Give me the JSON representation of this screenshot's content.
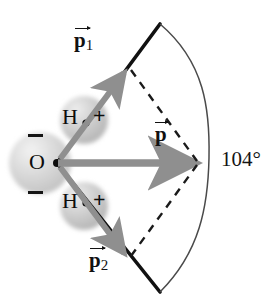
{
  "figure": {
    "background_color": "#ffffff",
    "width": 274,
    "height": 303
  },
  "molecule": {
    "oxygen": {
      "atom_label": "O",
      "charge_label_top": "−",
      "charge_label_bottom": "−",
      "sphere_color": "#d9d9d9",
      "center": [
        40,
        163
      ],
      "radius": 31
    },
    "hydrogens": [
      {
        "atom_label": "H",
        "charge_label": "+",
        "sphere_color": "#c9c9c9",
        "center": [
          84,
          120
        ],
        "radius": 24
      },
      {
        "atom_label": "H",
        "charge_label": "+",
        "sphere_color": "#c9c9c9",
        "center": [
          84,
          206
        ],
        "radius": 24
      }
    ],
    "bond_vertex": [
      57,
      163
    ],
    "bond_color": "#111111"
  },
  "vectors": [
    {
      "name": "p1",
      "label_text": "p",
      "label_subscript": "1",
      "arrow_color": "#8c8c8c",
      "from": [
        57,
        163
      ],
      "to": [
        128,
        68
      ],
      "label_position": [
        75,
        38
      ]
    },
    {
      "name": "p2",
      "label_text": "p",
      "label_subscript": "2",
      "arrow_color": "#8c8c8c",
      "from": [
        57,
        163
      ],
      "to": [
        128,
        258
      ],
      "label_position": [
        90,
        255
      ]
    },
    {
      "name": "p_resultant",
      "label_text": "p",
      "label_subscript": "",
      "arrow_color": "#8c8c8c",
      "from": [
        57,
        163
      ],
      "to": [
        199,
        163
      ],
      "label_position": [
        155,
        127
      ]
    }
  ],
  "construction": {
    "dashed_color": "#1a1a1a",
    "dashed_lines": [
      {
        "from": [
          131,
          70
        ],
        "to": [
          197,
          162
        ]
      },
      {
        "from": [
          131,
          256
        ],
        "to": [
          197,
          164
        ]
      }
    ],
    "bond_extensions": [
      {
        "from": [
          57,
          163
        ],
        "to": [
          160,
          24
        ]
      },
      {
        "from": [
          57,
          163
        ],
        "to": [
          160,
          292
        ]
      }
    ]
  },
  "angle": {
    "value_label": "104°",
    "arc_color": "#4a4a4a",
    "arc_from": [
      160,
      24
    ],
    "arc_to": [
      160,
      292
    ],
    "arc_apex": [
      209,
      158
    ],
    "label_position": [
      222,
      150
    ]
  }
}
